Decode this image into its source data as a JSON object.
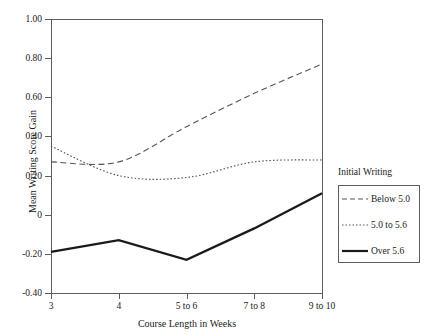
{
  "title_fragment": "Writing",
  "chart_data": {
    "type": "line",
    "title": "",
    "xlabel": "Course Length in Weeks",
    "ylabel": "Mean Writing Score Gain",
    "categories": [
      "3",
      "4",
      "5 to 6",
      "7 to 8",
      "9 to 10"
    ],
    "x_tick_labels": [
      "3",
      "4",
      "5 to 6",
      "7 to 8",
      "9 to 10"
    ],
    "y_tick_labels": [
      "1.00",
      "0.80",
      "0.60",
      "0.40",
      "0.20",
      "0",
      "-0.20",
      "-0.40"
    ],
    "y_tick_values": [
      1.0,
      0.8,
      0.6,
      0.4,
      0.2,
      0,
      -0.2,
      -0.4
    ],
    "ylim": [
      -0.4,
      1.0
    ],
    "grid": false,
    "legend_position": "right",
    "legend_title": "Initial Writing",
    "series": [
      {
        "name": "Below 5.0",
        "style": "dashed",
        "color": "#555555",
        "values": [
          0.27,
          0.27,
          0.45,
          0.62,
          0.77
        ]
      },
      {
        "name": "5.0 to 5.6",
        "style": "dotted",
        "color": "#555555",
        "values": [
          0.35,
          0.2,
          0.19,
          0.27,
          0.28
        ]
      },
      {
        "name": "Over 5.6",
        "style": "solid",
        "color": "#1a1a1a",
        "values": [
          -0.19,
          -0.13,
          -0.23,
          -0.07,
          0.11
        ]
      }
    ]
  },
  "legend": {
    "title": "Initial Writing",
    "items": [
      {
        "label": "Below 5.0",
        "style": "dashed"
      },
      {
        "label": "5.0 to 5.6",
        "style": "dotted"
      },
      {
        "label": "Over 5.6",
        "style": "solid"
      }
    ]
  },
  "colors": {
    "axis": "#5d5d5d",
    "text": "#1a1a1a",
    "series_light": "#555555",
    "series_dark": "#1a1a1a",
    "background": "#ffffff"
  }
}
